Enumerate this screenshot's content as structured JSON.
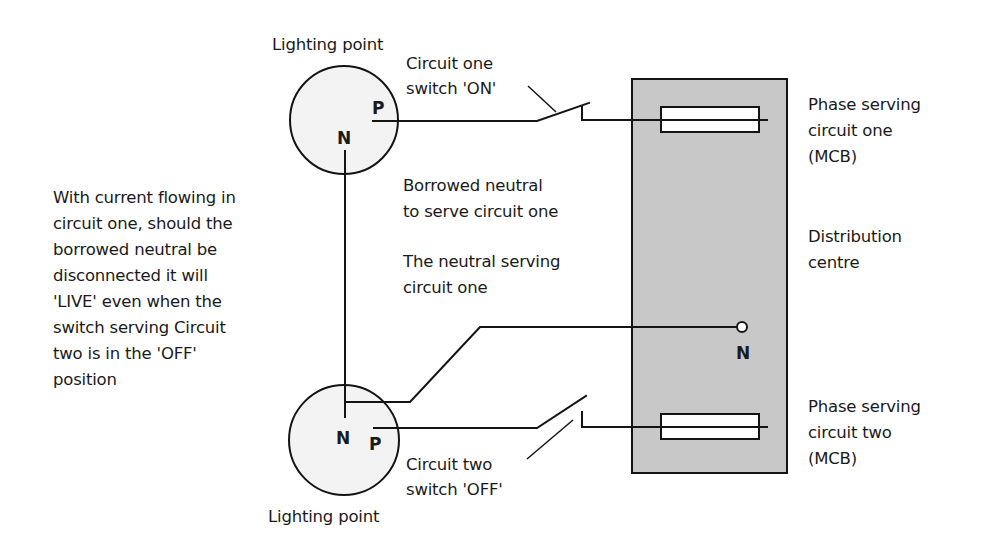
{
  "colors": {
    "line": "#141414",
    "distribution_fill": "#c8c8c8",
    "lamp_fill": "#f3f3f3",
    "mcb_fill": "#ffffff",
    "text": "#1a1a1a"
  },
  "lighting_point_top": {
    "label": "Lighting point",
    "phase_terminal": "P",
    "neutral_terminal": "N"
  },
  "lighting_point_bottom": {
    "label": "Lighting point",
    "phase_terminal": "P",
    "neutral_terminal": "N"
  },
  "switch_one": {
    "label_lines": [
      "Circuit one",
      "switch 'ON'"
    ],
    "state": "ON"
  },
  "switch_two": {
    "label_lines": [
      "Circuit two",
      "switch 'OFF'"
    ],
    "state": "OFF"
  },
  "borrowed_neutral_label": [
    "Borrowed neutral",
    "to serve circuit one"
  ],
  "neutral_serving_label": [
    "The neutral serving",
    "circuit one"
  ],
  "warning_note": [
    "With current flowing in",
    "circuit one, should the",
    "borrowed neutral be",
    "disconnected it will",
    "'LIVE' even when the",
    "switch serving Circuit",
    "two is in the 'OFF'",
    "position"
  ],
  "distribution_centre": {
    "label_lines": [
      "Distribution",
      "centre"
    ],
    "neutral_terminal": "N"
  },
  "mcb_one": {
    "label_lines": [
      "Phase serving",
      "circuit one",
      "(MCB)"
    ]
  },
  "mcb_two": {
    "label_lines": [
      "Phase serving",
      "circuit two",
      "(MCB)"
    ]
  }
}
